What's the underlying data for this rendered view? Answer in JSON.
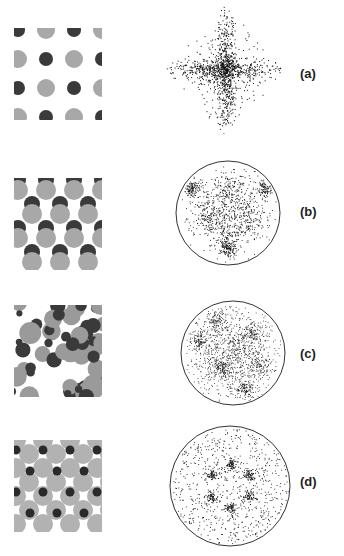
{
  "figure": {
    "panels": [
      {
        "id": "a",
        "label": "(a)",
        "lattice": "square array of alternating dark and light-grey circles",
        "pattern": "diamond/cross-shaped diffraction scatter, no boundary circle"
      },
      {
        "id": "b",
        "label": "(b)",
        "lattice": "rows of overlapping dark/grey circle pairs (dumbbells)",
        "pattern": "circular diffraction disk with three-fold V-shaped intensity"
      },
      {
        "id": "c",
        "label": "(c)",
        "lattice": "dense disordered packing of grey and dark circles of varying size",
        "pattern": "circular diffraction disk with diffuse square-like ring of 6 spots"
      },
      {
        "id": "d",
        "label": "(d)",
        "lattice": "hexagonal arrangement of light-grey circles with small dark circles",
        "pattern": "circular diffraction disk with six hexagonal spots"
      }
    ],
    "colors": {
      "dark": "#3a3a3a",
      "light": "#a8a8a8",
      "ink": "#222222"
    }
  }
}
